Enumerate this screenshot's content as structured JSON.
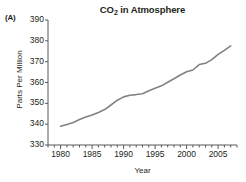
{
  "panel": {
    "label": "(A)"
  },
  "axis_labels": {
    "x": "Year",
    "y": "Parts Per Million"
  },
  "chart_data": {
    "type": "line",
    "title": "CO2 in Atmosphere",
    "title_parts": {
      "pre": "CO",
      "sub": "2",
      "post": " in Atmosphere"
    },
    "xlabel": "Year",
    "ylabel": "Parts Per Million",
    "xlim": [
      1978,
      2008
    ],
    "ylim": [
      330,
      390
    ],
    "ytick_values": [
      330,
      340,
      350,
      360,
      370,
      380,
      390
    ],
    "ytick_labels": [
      "330",
      "340",
      "350",
      "360",
      "370",
      "380",
      "390"
    ],
    "xtick_values": [
      1980,
      1985,
      1990,
      1995,
      2000,
      2005
    ],
    "xtick_labels": [
      "1980",
      "1985",
      "1990",
      "1995",
      "2000",
      "2005"
    ],
    "xminor_step": 1,
    "grid": false,
    "legend": false,
    "line_color": "#808285",
    "axis_color": "#58595b",
    "series": [
      {
        "name": "CO2 concentration",
        "x": [
          1980,
          1981,
          1982,
          1983,
          1984,
          1985,
          1986,
          1987,
          1988,
          1989,
          1990,
          1991,
          1992,
          1993,
          1994,
          1995,
          1996,
          1997,
          1998,
          1999,
          2000,
          2001,
          2002,
          2003,
          2004,
          2005,
          2006,
          2007
        ],
        "values": [
          339.0,
          339.8,
          340.8,
          342.2,
          343.4,
          344.4,
          345.6,
          347.0,
          349.2,
          351.5,
          353.1,
          353.9,
          354.2,
          354.6,
          356.0,
          357.2,
          358.4,
          360.1,
          361.8,
          363.6,
          365.2,
          366.0,
          368.6,
          369.2,
          371.0,
          373.5,
          375.4,
          377.6
        ]
      }
    ]
  }
}
